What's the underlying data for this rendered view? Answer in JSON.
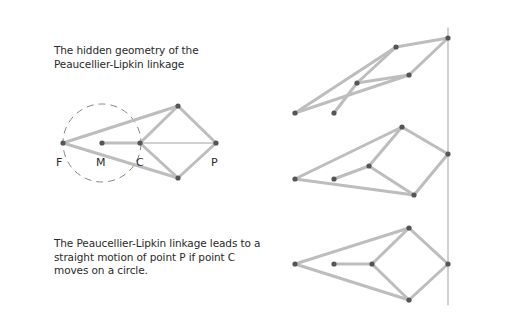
{
  "title": {
    "lines": [
      "The hidden geometry of the",
      "Peaucellier-Lipkin linkage"
    ]
  },
  "caption": {
    "lines": [
      "The Peaucellier-Lipkin linkage leads to a",
      "straight motion of point P if point C",
      "moves on a circle."
    ]
  },
  "labels": {
    "F": "F",
    "M": "M",
    "C": "C",
    "P": "P"
  },
  "colors": {
    "bar": "#bdbdbd",
    "joint": "#555555",
    "thin_line": "#999999",
    "circle": "#777777",
    "text": "#2a2a2a"
  },
  "diagrams": {
    "hidden_geometry": {
      "F": [
        63,
        143
      ],
      "M": [
        102,
        143
      ],
      "C": [
        140,
        143
      ],
      "top": [
        178,
        106
      ],
      "P": [
        216,
        143
      ],
      "bottom": [
        178,
        178
      ],
      "circle": {
        "center": [
          102,
          143
        ],
        "radius": 39
      }
    },
    "linkage_1": {
      "F": [
        295,
        113
      ],
      "M": [
        334,
        113
      ],
      "C": [
        357,
        83
      ],
      "top": [
        396,
        47
      ],
      "P": [
        448,
        38
      ],
      "bottom": [
        409,
        75
      ]
    },
    "linkage_2": {
      "F": [
        295,
        179
      ],
      "M": [
        334,
        179
      ],
      "C": [
        369,
        166
      ],
      "top": [
        402,
        127
      ],
      "P": [
        448,
        154
      ],
      "bottom": [
        414,
        195
      ]
    },
    "linkage_3": {
      "F": [
        295,
        264
      ],
      "M": [
        334,
        264
      ],
      "C": [
        372,
        264
      ],
      "top": [
        409,
        228
      ],
      "P": [
        448,
        264
      ],
      "bottom": [
        409,
        300
      ]
    },
    "straight_line": {
      "x": 448,
      "y1": 28,
      "y2": 305
    }
  }
}
